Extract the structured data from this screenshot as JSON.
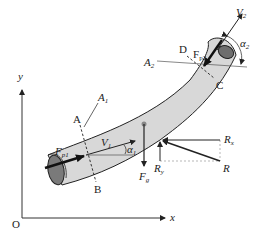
{
  "diagram": {
    "type": "fluid-mechanics-free-body",
    "colors": {
      "pipe_fill": "#d8d8d8",
      "pipe_end_fill": "#7a7a7a",
      "stroke": "#222222",
      "axis": "#333333",
      "dashed_guide": "#999999"
    },
    "axes": {
      "origin_label": "O",
      "x_label": "x",
      "y_label": "y"
    },
    "sections": {
      "inlet": {
        "point_top": "A",
        "point_bottom": "B",
        "area_label": "A",
        "area_sub": "1",
        "velocity_label": "V",
        "velocity_sub": "1",
        "angle_label": "α",
        "angle_sub": "1",
        "pressure_force_label": "F",
        "pressure_force_sub": "p1"
      },
      "outlet": {
        "point_top": "D",
        "point_bottom": "C",
        "area_label": "A",
        "area_sub": "2",
        "velocity_label": "V",
        "velocity_sub": "2",
        "angle_label": "α",
        "angle_sub": "2",
        "pressure_force_label": "F",
        "pressure_force_sub": "p2"
      }
    },
    "forces": {
      "gravity_label": "F",
      "gravity_sub": "g",
      "reaction_label": "R",
      "reaction_x_label": "R",
      "reaction_x_sub": "x",
      "reaction_y_label": "R",
      "reaction_y_sub": "y"
    }
  }
}
